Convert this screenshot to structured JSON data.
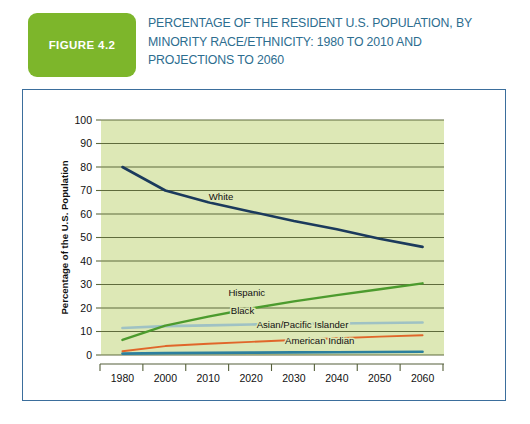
{
  "header": {
    "badge_label": "FIGURE 4.2",
    "badge_color": "#7db62b",
    "title": "PERCENTAGE OF THE RESIDENT U.S. POPULATION, BY MINORITY RACE/ETHNICITY: 1980 TO 2010 AND PROJECTIONS TO 2060",
    "title_color": "#2d6d8f"
  },
  "frame": {
    "border_color": "#3b6e9c",
    "background": "#ffffff"
  },
  "chart_data": {
    "type": "line",
    "title": "PERCENTAGE OF THE RESIDENT U.S. POPULATION, BY MINORITY RACE/ETHNICITY: 1980 TO 2010 AND PROJECTIONS TO 2060",
    "xlabel": "",
    "ylabel": "Percentage of the U.S. Population",
    "x": [
      1980,
      2000,
      2010,
      2020,
      2030,
      2040,
      2050,
      2060
    ],
    "xtick_labels": [
      "1980",
      "2000",
      "2010",
      "2020",
      "2030",
      "2040",
      "2050",
      "2060"
    ],
    "ytick_labels": [
      "0",
      "10",
      "20",
      "30",
      "40",
      "50",
      "60",
      "70",
      "80",
      "90",
      "100"
    ],
    "ylim": [
      0,
      100
    ],
    "ytick_step": 10,
    "grid": "horizontal",
    "legend_position": "inline-labels",
    "plot_background": "#dde8b6",
    "gridline_color": "#5f6b3c",
    "series": [
      {
        "name": "White",
        "color": "#1b3a5c",
        "label_x": 2013,
        "label_y": 66,
        "values": [
          80.0,
          70.0,
          65.0,
          61.0,
          57.0,
          53.5,
          49.5,
          46.0
        ]
      },
      {
        "name": "Hispanic",
        "color": "#4c9b2e",
        "label_x": 2019,
        "label_y": 25,
        "values": [
          6.4,
          12.5,
          16.3,
          19.8,
          22.8,
          25.5,
          28.0,
          30.5
        ]
      },
      {
        "name": "Black",
        "color": "#9fc2c4",
        "label_x": 2018,
        "label_y": 17.5,
        "values": [
          11.5,
          12.3,
          12.6,
          13.0,
          13.2,
          13.4,
          13.6,
          13.8
        ]
      },
      {
        "name": "Asian/Pacific Islander",
        "color": "#e0662a",
        "label_x": 2032,
        "label_y": 11.5,
        "values": [
          1.6,
          3.8,
          4.8,
          5.6,
          6.4,
          7.1,
          7.8,
          8.4
        ]
      },
      {
        "name": "American Indian",
        "color": "#2c7f9e",
        "label_x": 2036,
        "label_y": 4.8,
        "values": [
          0.6,
          0.8,
          0.9,
          1.0,
          1.1,
          1.2,
          1.3,
          1.4
        ]
      }
    ]
  }
}
